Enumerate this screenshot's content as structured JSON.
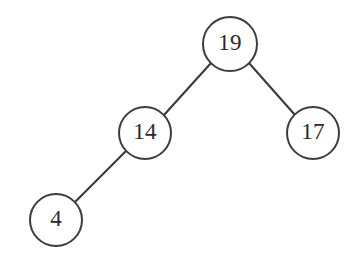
{
  "figure": {
    "background_color": "#ffffff",
    "stroke_color": "#3c3c3c",
    "label_color": "#2a2a2a",
    "width": 363,
    "height": 265
  },
  "chart_data": {
    "type": "diagram",
    "diagram_type": "binary-tree",
    "title": "",
    "nodes": [
      {
        "id": "n19",
        "label": "19",
        "cx": 230,
        "cy": 44,
        "r": 27,
        "depth": 0,
        "role": "root"
      },
      {
        "id": "n14",
        "label": "14",
        "cx": 145,
        "cy": 133,
        "r": 26,
        "depth": 1,
        "role": "left-child"
      },
      {
        "id": "n17",
        "label": "17",
        "cx": 313,
        "cy": 133,
        "r": 26,
        "depth": 1,
        "role": "right-child"
      },
      {
        "id": "n4",
        "label": "4",
        "cx": 56,
        "cy": 220,
        "r": 26,
        "depth": 2,
        "role": "left-child"
      }
    ],
    "edges": [
      {
        "id": "e19-14",
        "from": "n19",
        "to": "n14",
        "x1": 211,
        "y1": 63,
        "x2": 164,
        "y2": 115
      },
      {
        "id": "e19-17",
        "from": "n19",
        "to": "n17",
        "x1": 249,
        "y1": 63,
        "x2": 295,
        "y2": 115
      },
      {
        "id": "e14-4",
        "from": "n14",
        "to": "n4",
        "x1": 126,
        "y1": 151,
        "x2": 75,
        "y2": 202
      }
    ]
  }
}
